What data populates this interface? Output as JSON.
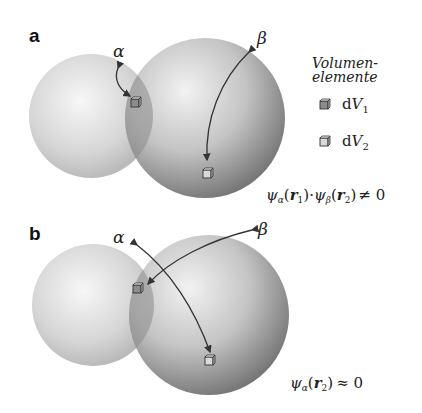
{
  "panels": [
    {
      "label": "a",
      "orbital_alpha_label": "α",
      "orbital_beta_label": "β",
      "formula": "ψα(r1)·ψβ(r2) ≠ 0",
      "formula_parts": {
        "psi": "ψ",
        "sub_a": "α",
        "r1": "r",
        "i1": "1",
        "dot": "·",
        "sub_b": "β",
        "r2": "r",
        "i2": "2",
        "rel": "≠ 0"
      }
    },
    {
      "label": "b",
      "orbital_alpha_label": "α",
      "orbital_beta_label": "β",
      "formula": "ψα(r2) ≈ 0",
      "formula_parts": {
        "psi": "ψ",
        "sub_a": "α",
        "r2": "r",
        "i2": "2",
        "rel": "≈ 0"
      }
    }
  ],
  "legend": {
    "title_line1": "Volumen-",
    "title_line2": "elemente",
    "items": [
      {
        "symbol": "d",
        "var": "V",
        "index": "1",
        "color": "#8c8c8c"
      },
      {
        "symbol": "d",
        "var": "V",
        "index": "2",
        "color": "#d9d9d9"
      }
    ]
  },
  "colors": {
    "sphere_small_light": "#f2f2f2",
    "sphere_small_dark": "#b5b5b5",
    "sphere_large_light": "#f0f0f0",
    "sphere_large_dark": "#6e6e6e",
    "overlap": "#9a9a9a",
    "arrow": "#333333"
  }
}
